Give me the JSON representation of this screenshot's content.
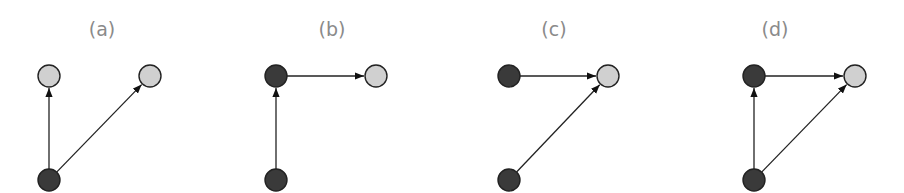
{
  "colors": {
    "observed_node": "#3a3a3a",
    "latent_node": "#d0d0d0",
    "edge": "#222222",
    "label": "#8a8a8a"
  },
  "panels": [
    {
      "id": "a",
      "label": "(a)",
      "label_pos": [
        102,
        36
      ],
      "nodes": [
        {
          "id": "top-left",
          "x": 49,
          "y": 76,
          "type": "latent"
        },
        {
          "id": "top-right",
          "x": 150,
          "y": 76,
          "type": "latent"
        },
        {
          "id": "bottom",
          "x": 49,
          "y": 180,
          "type": "observed"
        }
      ],
      "edges": [
        {
          "from": "bottom",
          "to": "top-left"
        },
        {
          "from": "bottom",
          "to": "top-right"
        }
      ]
    },
    {
      "id": "b",
      "label": "(b)",
      "label_pos": [
        332,
        36
      ],
      "nodes": [
        {
          "id": "top-left",
          "x": 276,
          "y": 76,
          "type": "observed"
        },
        {
          "id": "top-right",
          "x": 376,
          "y": 76,
          "type": "latent"
        },
        {
          "id": "bottom",
          "x": 276,
          "y": 180,
          "type": "observed"
        }
      ],
      "edges": [
        {
          "from": "bottom",
          "to": "top-left"
        },
        {
          "from": "top-left",
          "to": "top-right"
        }
      ]
    },
    {
      "id": "c",
      "label": "(c)",
      "label_pos": [
        554,
        36
      ],
      "nodes": [
        {
          "id": "top-left",
          "x": 509,
          "y": 76,
          "type": "observed"
        },
        {
          "id": "top-right",
          "x": 608,
          "y": 76,
          "type": "latent"
        },
        {
          "id": "bottom",
          "x": 509,
          "y": 180,
          "type": "observed"
        }
      ],
      "edges": [
        {
          "from": "top-left",
          "to": "top-right"
        },
        {
          "from": "bottom",
          "to": "top-right"
        }
      ]
    },
    {
      "id": "d",
      "label": "(d)",
      "label_pos": [
        775,
        36
      ],
      "nodes": [
        {
          "id": "top-left",
          "x": 754,
          "y": 76,
          "type": "observed"
        },
        {
          "id": "top-right",
          "x": 855,
          "y": 76,
          "type": "latent"
        },
        {
          "id": "bottom",
          "x": 754,
          "y": 180,
          "type": "observed"
        }
      ],
      "edges": [
        {
          "from": "bottom",
          "to": "top-left"
        },
        {
          "from": "top-left",
          "to": "top-right"
        },
        {
          "from": "bottom",
          "to": "top-right"
        }
      ]
    }
  ],
  "node_radius": 11
}
